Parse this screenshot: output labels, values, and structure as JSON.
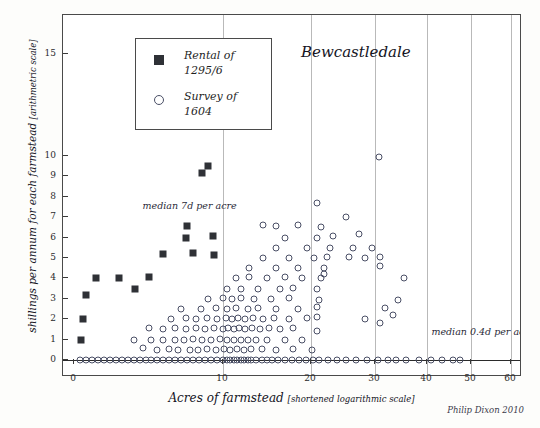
{
  "chart_data": {
    "type": "scatter",
    "title": "Bewcastledale",
    "xlabel": "Acres of farmstead [shortened logarithmic scale]",
    "ylabel_main": "shillings per annum for each farmstead ",
    "ylabel_sub": "[arithmetric scale]",
    "credit": "Philip Dixon 2010",
    "xlim": [
      0,
      66
    ],
    "ylim": [
      -0.55,
      16
    ],
    "grid": "vertical gridlines at 10, 20, 30, 40, 50, 60",
    "xticks": [
      0,
      10,
      20,
      30,
      40,
      50,
      60
    ],
    "xticklabels": [
      "0",
      "10",
      "20",
      "30",
      "40",
      "50",
      "60"
    ],
    "yticks": [
      0,
      1,
      2,
      3,
      4,
      5,
      6,
      7,
      8,
      9,
      10,
      15
    ],
    "yticklabels": [
      "0",
      "1",
      "2",
      "3",
      "4",
      "5",
      "6",
      "7",
      "8",
      "9",
      "10",
      "15"
    ],
    "gridlines_x": [
      10,
      20,
      30,
      40,
      50,
      60
    ],
    "legend": {
      "position": "top-left inside axes",
      "entries": [
        {
          "marker": "filled-square",
          "label_line1": "Rental of",
          "label_line2": "1295/6"
        },
        {
          "marker": "open-circle",
          "label_line1": "Survey of",
          "label_line2": "1604"
        }
      ]
    },
    "annotations": [
      {
        "text": "median 7d per acre",
        "x": 4.6,
        "y": 7.55
      },
      {
        "text": "median 0.4d per acre",
        "x": 41.0,
        "y": 1.35
      }
    ],
    "series": [
      {
        "name": "Rental of 1295/6",
        "marker": "filled-square",
        "color": "#2f3136",
        "points": [
          [
            0.5,
            1.0
          ],
          [
            0.6,
            2.0
          ],
          [
            0.8,
            3.2
          ],
          [
            1.5,
            4.0
          ],
          [
            3.0,
            4.0
          ],
          [
            4.1,
            3.5
          ],
          [
            5.0,
            4.05
          ],
          [
            6.0,
            5.2
          ],
          [
            7.5,
            6.0
          ],
          [
            7.6,
            6.55
          ],
          [
            8.0,
            5.25
          ],
          [
            8.6,
            9.15
          ],
          [
            9.0,
            9.5
          ],
          [
            9.3,
            6.1
          ],
          [
            9.4,
            5.15
          ]
        ]
      },
      {
        "name": "Survey of 1604",
        "marker": "open-circle",
        "color": "#4a4f66",
        "points": [
          [
            0.4,
            0.0
          ],
          [
            0.8,
            0.0
          ],
          [
            1.2,
            0.0
          ],
          [
            1.6,
            0.0
          ],
          [
            2.0,
            0.0
          ],
          [
            2.4,
            0.0
          ],
          [
            2.8,
            0.0
          ],
          [
            3.2,
            0.0
          ],
          [
            3.6,
            0.0
          ],
          [
            4.0,
            0.0
          ],
          [
            4.4,
            0.0
          ],
          [
            4.8,
            0.0
          ],
          [
            5.2,
            0.0
          ],
          [
            5.6,
            0.0
          ],
          [
            6.0,
            0.0
          ],
          [
            6.4,
            0.0
          ],
          [
            6.8,
            0.0
          ],
          [
            7.2,
            0.0
          ],
          [
            7.6,
            0.0
          ],
          [
            8.0,
            0.0
          ],
          [
            8.4,
            0.0
          ],
          [
            8.8,
            0.0
          ],
          [
            9.2,
            0.0
          ],
          [
            9.6,
            0.0
          ],
          [
            10.0,
            0.0
          ],
          [
            10.4,
            0.0
          ],
          [
            10.8,
            0.0
          ],
          [
            11.2,
            0.0
          ],
          [
            11.6,
            0.0
          ],
          [
            12.0,
            0.0
          ],
          [
            12.4,
            0.0
          ],
          [
            12.8,
            0.0
          ],
          [
            13.2,
            0.0
          ],
          [
            13.8,
            0.0
          ],
          [
            14.4,
            0.0
          ],
          [
            15.0,
            0.0
          ],
          [
            15.6,
            0.0
          ],
          [
            16.2,
            0.0
          ],
          [
            17.0,
            0.0
          ],
          [
            17.8,
            0.0
          ],
          [
            18.6,
            0.0
          ],
          [
            19.4,
            0.0
          ],
          [
            20.3,
            0.0
          ],
          [
            21.2,
            0.0
          ],
          [
            22.6,
            0.0
          ],
          [
            24.0,
            0.0
          ],
          [
            25.5,
            0.0
          ],
          [
            27.0,
            0.0
          ],
          [
            28.8,
            0.0
          ],
          [
            30.6,
            0.0
          ],
          [
            32.5,
            0.0
          ],
          [
            34.0,
            0.0
          ],
          [
            36.0,
            0.0
          ],
          [
            38.5,
            0.0
          ],
          [
            41.0,
            0.0
          ],
          [
            43.5,
            0.0
          ],
          [
            46.0,
            0.0
          ],
          [
            47.5,
            0.0
          ],
          [
            4.0,
            1.0
          ],
          [
            4.6,
            0.6
          ],
          [
            5.2,
            1.0
          ],
          [
            5.6,
            0.5
          ],
          [
            6.0,
            1.0
          ],
          [
            6.4,
            0.55
          ],
          [
            6.8,
            1.0
          ],
          [
            7.0,
            0.5
          ],
          [
            7.4,
            1.0
          ],
          [
            7.8,
            0.5
          ],
          [
            8.0,
            1.05
          ],
          [
            8.3,
            0.5
          ],
          [
            8.6,
            1.0
          ],
          [
            8.9,
            0.55
          ],
          [
            9.2,
            1.0
          ],
          [
            9.5,
            0.5
          ],
          [
            9.8,
            1.05
          ],
          [
            10.1,
            0.55
          ],
          [
            10.4,
            1.0
          ],
          [
            10.8,
            0.5
          ],
          [
            11.2,
            1.0
          ],
          [
            11.6,
            0.55
          ],
          [
            12.0,
            1.0
          ],
          [
            12.4,
            0.5
          ],
          [
            12.8,
            1.0
          ],
          [
            13.2,
            0.55
          ],
          [
            13.8,
            1.0
          ],
          [
            14.4,
            0.55
          ],
          [
            15.0,
            1.0
          ],
          [
            16.0,
            0.5
          ],
          [
            17.0,
            1.0
          ],
          [
            18.0,
            0.55
          ],
          [
            19.0,
            1.0
          ],
          [
            20.2,
            0.5
          ],
          [
            5.0,
            1.55
          ],
          [
            6.0,
            1.5
          ],
          [
            6.8,
            1.55
          ],
          [
            7.5,
            1.5
          ],
          [
            8.2,
            1.55
          ],
          [
            8.8,
            1.5
          ],
          [
            9.4,
            1.55
          ],
          [
            10.0,
            1.5
          ],
          [
            10.6,
            1.55
          ],
          [
            11.2,
            1.5
          ],
          [
            11.8,
            1.55
          ],
          [
            12.5,
            1.5
          ],
          [
            13.3,
            1.55
          ],
          [
            14.2,
            1.5
          ],
          [
            15.2,
            1.55
          ],
          [
            16.5,
            1.5
          ],
          [
            18.0,
            1.55
          ],
          [
            21.0,
            1.4
          ],
          [
            6.5,
            2.0
          ],
          [
            7.5,
            2.05
          ],
          [
            8.2,
            2.0
          ],
          [
            8.9,
            2.05
          ],
          [
            9.6,
            2.0
          ],
          [
            10.3,
            2.05
          ],
          [
            11.0,
            2.0
          ],
          [
            11.7,
            2.05
          ],
          [
            12.5,
            2.0
          ],
          [
            13.4,
            2.05
          ],
          [
            14.5,
            2.0
          ],
          [
            15.8,
            2.05
          ],
          [
            17.5,
            2.0
          ],
          [
            19.5,
            2.05
          ],
          [
            21.0,
            2.1
          ],
          [
            28.5,
            2.0
          ],
          [
            31.0,
            1.8
          ],
          [
            33.5,
            2.2
          ],
          [
            7.2,
            2.5
          ],
          [
            8.5,
            2.5
          ],
          [
            9.5,
            2.55
          ],
          [
            10.5,
            2.5
          ],
          [
            11.5,
            2.55
          ],
          [
            12.8,
            2.5
          ],
          [
            14.0,
            2.55
          ],
          [
            16.0,
            2.5
          ],
          [
            18.5,
            2.5
          ],
          [
            21.0,
            2.6
          ],
          [
            32.0,
            2.55
          ],
          [
            9.0,
            3.0
          ],
          [
            10.0,
            3.05
          ],
          [
            11.0,
            3.0
          ],
          [
            12.0,
            3.05
          ],
          [
            13.5,
            3.0
          ],
          [
            15.5,
            3.0
          ],
          [
            17.5,
            3.05
          ],
          [
            21.3,
            2.95
          ],
          [
            34.5,
            2.95
          ],
          [
            10.5,
            3.5
          ],
          [
            12.0,
            3.5
          ],
          [
            14.0,
            3.5
          ],
          [
            16.5,
            3.5
          ],
          [
            18.0,
            3.55
          ],
          [
            21.0,
            3.5
          ],
          [
            11.5,
            4.0
          ],
          [
            13.0,
            4.05
          ],
          [
            15.0,
            4.0
          ],
          [
            17.0,
            4.05
          ],
          [
            19.0,
            4.0
          ],
          [
            21.5,
            4.0
          ],
          [
            22.0,
            4.2
          ],
          [
            35.5,
            4.0
          ],
          [
            13.0,
            4.5
          ],
          [
            16.0,
            4.5
          ],
          [
            18.5,
            4.5
          ],
          [
            22.0,
            4.5
          ],
          [
            31.0,
            4.6
          ],
          [
            14.5,
            5.0
          ],
          [
            17.5,
            5.0
          ],
          [
            20.5,
            5.0
          ],
          [
            22.5,
            5.05
          ],
          [
            26.0,
            5.05
          ],
          [
            28.5,
            5.0
          ],
          [
            31.0,
            5.05
          ],
          [
            16.0,
            5.5
          ],
          [
            19.5,
            5.5
          ],
          [
            23.0,
            5.5
          ],
          [
            26.5,
            5.5
          ],
          [
            29.5,
            5.5
          ],
          [
            17.0,
            6.0
          ],
          [
            21.0,
            6.0
          ],
          [
            23.5,
            6.1
          ],
          [
            27.5,
            6.2
          ],
          [
            14.5,
            6.6
          ],
          [
            16.0,
            6.55
          ],
          [
            18.5,
            6.6
          ],
          [
            21.5,
            6.5
          ],
          [
            21.0,
            7.7
          ],
          [
            25.5,
            7.0
          ],
          [
            30.8,
            9.95
          ],
          [
            63.5,
            14.8
          ]
        ]
      }
    ]
  }
}
